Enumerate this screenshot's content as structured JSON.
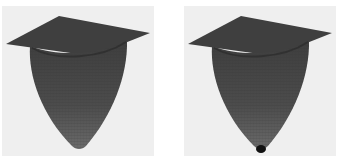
{
  "figure": {
    "panels": [
      {
        "id": "left",
        "description": "3D surface plot of a paraboloid potential well attached to a flat square plane",
        "surface_color": "#4a4a4a",
        "mesh_color": "#2a2a2a",
        "background": "#efefef",
        "has_tip_marker": false
      },
      {
        "id": "right",
        "description": "3D surface plot of a paraboloid potential well with a small dark sphere at its bottom",
        "surface_color": "#4a4a4a",
        "mesh_color": "#2a2a2a",
        "background": "#efefef",
        "has_tip_marker": true,
        "tip_marker_color": "#111111"
      }
    ]
  }
}
